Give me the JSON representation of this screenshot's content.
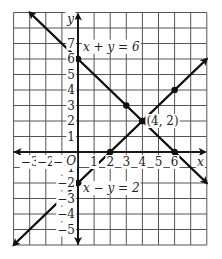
{
  "figure": {
    "xaxis_label": "x",
    "yaxis_label": "y",
    "origin_label": "O",
    "x_ticks": [
      "−3",
      "−2",
      "−1",
      "1",
      "2",
      "3",
      "4",
      "5",
      "6"
    ],
    "y_ticks": [
      "7",
      "6",
      "5",
      "4",
      "3",
      "2",
      "1",
      "−1",
      "−2",
      "−3",
      "−4",
      "−5"
    ],
    "line1_label": "x + y = 6",
    "line2_label": "x − y = 2",
    "intersection_label": "(4, 2)",
    "grid_color": "#555555",
    "line_color": "#111111"
  },
  "chart_data": {
    "type": "line",
    "title": "",
    "xlabel": "x",
    "ylabel": "y",
    "xlim": [
      -4,
      8
    ],
    "ylim": [
      -6,
      9
    ],
    "grid": true,
    "series": [
      {
        "name": "x + y = 6",
        "points": [
          [
            0,
            6
          ],
          [
            3,
            3
          ],
          [
            4,
            2
          ],
          [
            6,
            0
          ]
        ]
      },
      {
        "name": "x - y = 2",
        "points": [
          [
            0,
            -2
          ],
          [
            2,
            0
          ],
          [
            4,
            2
          ],
          [
            6,
            4
          ]
        ]
      }
    ],
    "annotations": [
      {
        "text": "(4, 2)",
        "x": 4,
        "y": 2
      }
    ]
  }
}
